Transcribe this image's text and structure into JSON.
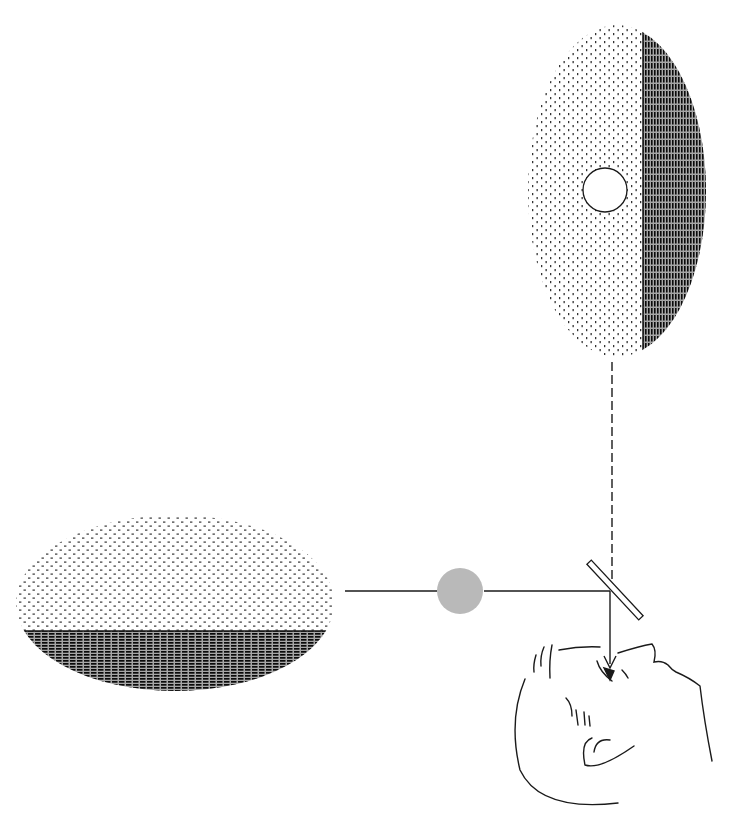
{
  "figure": {
    "title": "",
    "width": 736,
    "height": 832,
    "background": "#ffffff",
    "ink": "#1a1a1a"
  },
  "top_field": {
    "label": "",
    "bounds": {
      "x": 528,
      "y": 25,
      "w": 178,
      "h": 332
    },
    "divider_x": 643,
    "light_side": "left",
    "dark_side": "right",
    "light_texture": "stipple-sparse",
    "dark_texture": "hatch-dense",
    "test_disc": {
      "cx": 605,
      "cy": 190,
      "r": 22,
      "fill": "#ffffff",
      "stroke": "#1a1a1a"
    }
  },
  "left_field": {
    "label": "",
    "bounds": {
      "x": 16,
      "y": 515,
      "w": 318,
      "h": 177
    },
    "divider_y": 631,
    "light_side": "top",
    "dark_side": "bottom",
    "light_texture": "stipple-sparse",
    "dark_texture": "hatch-dense"
  },
  "optical_path": {
    "horizontal_line": {
      "x1": 345,
      "y1": 591,
      "x2": 610,
      "y2": 591
    },
    "grey_disc": {
      "cx": 460,
      "cy": 591,
      "r": 23,
      "fill": "#b9b9b9"
    },
    "dashed_line": {
      "x1": 612,
      "y1": 362,
      "x2": 612,
      "y2": 588,
      "dash": "9,4"
    },
    "mirror": {
      "x1": 590,
      "y1": 563,
      "x2": 640,
      "y2": 618,
      "thickness": 6
    },
    "arrow": {
      "x1": 610,
      "y1": 591,
      "x2": 610,
      "y2": 670
    }
  },
  "observer": {
    "label": "",
    "icon": "viewer-head-icon",
    "position": {
      "x": 505,
      "y": 640
    }
  }
}
